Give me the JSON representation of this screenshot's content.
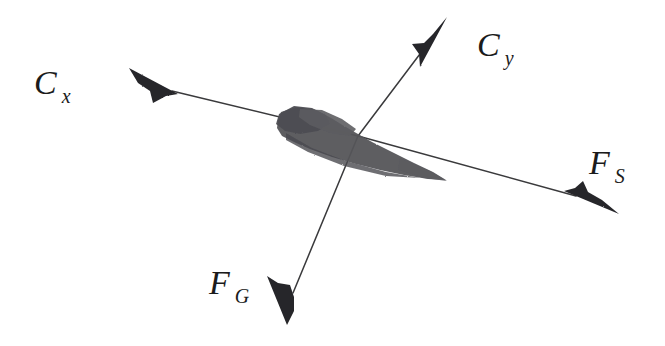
{
  "figure": {
    "background_color": "#ffffff",
    "ink_color": "#2b2b2b",
    "body_fill_color": "#56565a",
    "width": 665,
    "height": 346
  },
  "labels": {
    "drag": {
      "base": "C",
      "sub": "x",
      "full": "C x"
    },
    "lift": {
      "base": "C",
      "sub": "y",
      "full": "C y"
    },
    "thrust": {
      "base": "F",
      "sub": "S",
      "full": "F S"
    },
    "weight": {
      "base": "F",
      "sub": "G",
      "full": "F G"
    }
  },
  "diagram_data": {
    "type": "free-body-diagram",
    "origin": {
      "x": 358,
      "y": 136
    },
    "vectors": [
      {
        "name": "drag",
        "label": "C x",
        "from": {
          "x": 358,
          "y": 136
        },
        "to": {
          "x": 131,
          "y": 70
        },
        "direction": "upper-left",
        "arrowhead": "filled-triangle"
      },
      {
        "name": "lift",
        "label": "C y",
        "from": {
          "x": 358,
          "y": 136
        },
        "to": {
          "x": 447,
          "y": 18
        },
        "direction": "upper-right",
        "arrowhead": "filled-triangle"
      },
      {
        "name": "thrust",
        "label": "F S",
        "from": {
          "x": 358,
          "y": 136
        },
        "to": {
          "x": 618,
          "y": 213
        },
        "direction": "lower-right",
        "arrowhead": "filled-triangle"
      },
      {
        "name": "weight",
        "label": "F G",
        "from": {
          "x": 358,
          "y": 136
        },
        "to": {
          "x": 288,
          "y": 325
        },
        "direction": "downward",
        "arrowhead": "filled-triangle"
      }
    ],
    "object": {
      "name": "glider-silhouette",
      "bounds": {
        "x": 276,
        "y": 105,
        "width": 172,
        "height": 78
      }
    }
  }
}
